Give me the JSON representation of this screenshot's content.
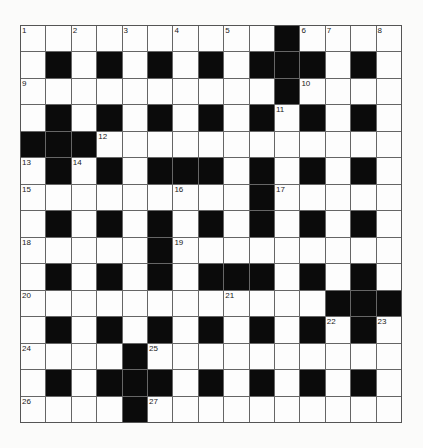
{
  "puzzle": {
    "rows": 15,
    "cols": 15,
    "layout": [
      "..........#....",
      ".#.#.#.#.###.#.",
      "..........#....",
      ".#.#.#.#.#.#.#.",
      "###............",
      ".#.#.###.#.#.#.",
      ".........#.....",
      ".#.#.#.#.#.#.#.",
      ".....#.........",
      ".#.#.#.###.#.#.",
      "............###",
      ".#.#.#.#.#.#.#.",
      "....#..........",
      ".#.###.#.#.#.#.",
      "....#.........."
    ],
    "numbers": [
      {
        "n": "1",
        "r": 0,
        "c": 0
      },
      {
        "n": "2",
        "r": 0,
        "c": 2
      },
      {
        "n": "3",
        "r": 0,
        "c": 4
      },
      {
        "n": "4",
        "r": 0,
        "c": 6
      },
      {
        "n": "5",
        "r": 0,
        "c": 8
      },
      {
        "n": "6",
        "r": 0,
        "c": 11
      },
      {
        "n": "7",
        "r": 0,
        "c": 12
      },
      {
        "n": "8",
        "r": 0,
        "c": 14
      },
      {
        "n": "9",
        "r": 2,
        "c": 0
      },
      {
        "n": "10",
        "r": 2,
        "c": 11
      },
      {
        "n": "11",
        "r": 3,
        "c": 10
      },
      {
        "n": "12",
        "r": 4,
        "c": 3
      },
      {
        "n": "13",
        "r": 5,
        "c": 0
      },
      {
        "n": "14",
        "r": 5,
        "c": 2
      },
      {
        "n": "15",
        "r": 6,
        "c": 0
      },
      {
        "n": "16",
        "r": 6,
        "c": 6
      },
      {
        "n": "17",
        "r": 6,
        "c": 10
      },
      {
        "n": "18",
        "r": 8,
        "c": 0
      },
      {
        "n": "19",
        "r": 8,
        "c": 6
      },
      {
        "n": "20",
        "r": 10,
        "c": 0
      },
      {
        "n": "21",
        "r": 10,
        "c": 8
      },
      {
        "n": "22",
        "r": 11,
        "c": 12
      },
      {
        "n": "23",
        "r": 11,
        "c": 14
      },
      {
        "n": "24",
        "r": 12,
        "c": 0
      },
      {
        "n": "25",
        "r": 12,
        "c": 5
      },
      {
        "n": "26",
        "r": 14,
        "c": 0
      },
      {
        "n": "27",
        "r": 14,
        "c": 5
      }
    ],
    "colors": {
      "block": "#0b0b0b",
      "cell": "#fdfdfd",
      "gridline": "#666666",
      "background": "#fbfbfa"
    }
  }
}
